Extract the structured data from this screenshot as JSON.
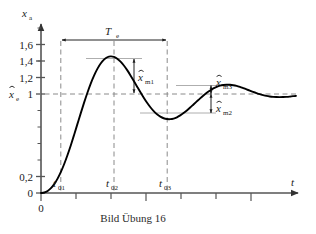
{
  "figure": {
    "caption": "Bild Übung 16",
    "axis": {
      "y_label": "x",
      "y_label_sub": "a",
      "x_label": "t",
      "y_ticks": [
        {
          "value": 1.6,
          "label": "1,6"
        },
        {
          "value": 1.4,
          "label": "1,4"
        },
        {
          "value": 1.2,
          "label": "1,2"
        },
        {
          "value": 1.0,
          "label": "1"
        },
        {
          "value": 0.2,
          "label": "0,2"
        },
        {
          "value": 0.0,
          "label": "0"
        }
      ],
      "y_minor_ticks": [
        1.8,
        1.5,
        1.3,
        1.1,
        0.9,
        0.8,
        0.7,
        0.6,
        0.5,
        0.4,
        0.3,
        0.1
      ],
      "x_origin_label": "0",
      "x_tick_labels": [
        "t",
        "t",
        "t"
      ],
      "x_tick_subs": [
        "01",
        "02",
        "03"
      ]
    },
    "annotations": {
      "steady_state": {
        "label": "x",
        "sub": "e",
        "value": 1.0
      },
      "period": {
        "label": "T",
        "sub": "e"
      },
      "overshoot_1": {
        "label": "x",
        "sub": "m1"
      },
      "overshoot_2": {
        "label": "x",
        "sub": "m2"
      },
      "overshoot_3": {
        "label": "x",
        "sub": "m3"
      }
    },
    "colors": {
      "curve": "#000000",
      "axis": "#555555",
      "dashed": "#888888",
      "thin_line": "#999999",
      "text": "#1a1a1a"
    }
  },
  "chart_data": {
    "type": "line",
    "title": "Bild Übung 16",
    "xlabel": "t",
    "ylabel": "x_a",
    "ylim": [
      0,
      1.85
    ],
    "xlim": [
      0,
      1.0
    ],
    "grid": false,
    "legend": false,
    "yticks": [
      0,
      0.2,
      1.0,
      1.2,
      1.4,
      1.6
    ],
    "ytick_labels": [
      "0",
      "0,2",
      "1",
      "1,2",
      "1,4",
      "1,6"
    ],
    "annotated_points": {
      "t01": 0.155,
      "t02": 0.385,
      "t03": 0.615,
      "peak_1": {
        "t": 0.265,
        "value": 1.43
      },
      "trough_1": {
        "t": 0.5,
        "value": 0.835
      },
      "peak_2": {
        "t": 0.735,
        "value": 1.07
      },
      "steady_state": 1.0,
      "period_Te": 0.46,
      "x_m1": 0.43,
      "x_m2": 0.165,
      "x_m3": 0.07
    },
    "series": [
      {
        "name": "x_a(t)",
        "x": [
          0.0,
          0.013,
          0.026,
          0.039,
          0.052,
          0.065,
          0.078,
          0.091,
          0.104,
          0.117,
          0.13,
          0.143,
          0.156,
          0.169,
          0.182,
          0.195,
          0.208,
          0.221,
          0.234,
          0.247,
          0.26,
          0.273,
          0.286,
          0.299,
          0.312,
          0.325,
          0.338,
          0.351,
          0.364,
          0.377,
          0.39,
          0.403,
          0.416,
          0.429,
          0.442,
          0.455,
          0.468,
          0.481,
          0.494,
          0.507,
          0.52,
          0.533,
          0.546,
          0.559,
          0.572,
          0.585,
          0.598,
          0.611,
          0.624,
          0.637,
          0.65,
          0.663,
          0.676,
          0.689,
          0.702,
          0.715,
          0.728,
          0.741,
          0.754,
          0.767,
          0.78,
          0.793,
          0.806,
          0.819,
          0.832,
          0.845,
          0.858,
          0.871,
          0.884,
          0.897,
          0.91,
          0.923,
          0.936,
          0.949,
          0.962,
          0.975,
          0.988,
          1.0
        ],
        "y": [
          0.0,
          0.005,
          0.021,
          0.049,
          0.09,
          0.145,
          0.213,
          0.293,
          0.384,
          0.483,
          0.589,
          0.698,
          0.807,
          0.913,
          1.013,
          1.105,
          1.186,
          1.254,
          1.308,
          1.347,
          1.371,
          1.38,
          1.375,
          1.357,
          1.327,
          1.288,
          1.241,
          1.188,
          1.132,
          1.074,
          1.017,
          0.962,
          0.911,
          0.866,
          0.827,
          0.795,
          0.771,
          0.755,
          0.747,
          0.746,
          0.752,
          0.765,
          0.784,
          0.807,
          0.834,
          0.863,
          0.894,
          0.925,
          0.956,
          0.985,
          1.012,
          1.036,
          1.056,
          1.072,
          1.084,
          1.091,
          1.094,
          1.093,
          1.089,
          1.082,
          1.072,
          1.06,
          1.047,
          1.034,
          1.021,
          1.009,
          0.998,
          0.989,
          0.981,
          0.975,
          0.971,
          0.969,
          0.968,
          0.969,
          0.971,
          0.974,
          0.978,
          0.981
        ]
      }
    ]
  }
}
